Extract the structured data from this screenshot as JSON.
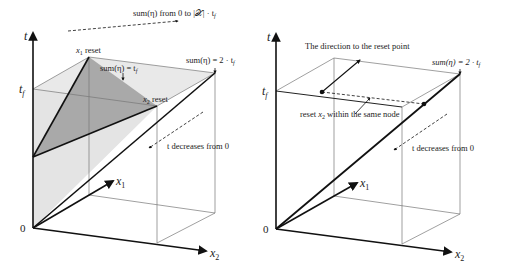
{
  "left_panel": {
    "axis_t": "t",
    "axis_x1": "x",
    "axis_x1_sub": "1",
    "axis_x2": "x",
    "axis_x2_sub": "2",
    "origin": "0",
    "tick_tf": "t",
    "tick_tf_sub": "f",
    "annotation_top": "sum(η) from 0 to |𝒳| · t",
    "annotation_top_sub": "f",
    "x1_reset": "reset",
    "x1_reset_var": "x",
    "x1_reset_sub": "1",
    "x2_reset": "reset",
    "x2_reset_var": "x",
    "x2_reset_sub": "2",
    "sum_eq_tf": "sum(η) = t",
    "sum_eq_tf_sub": "f",
    "sum_eq_2tf": "sum(η) = 2 · t",
    "sum_eq_2tf_sub": "f",
    "t_decreases": "t decreases from 0"
  },
  "right_panel": {
    "axis_t": "t",
    "axis_x1": "x",
    "axis_x1_sub": "1",
    "axis_x2": "x",
    "axis_x2_sub": "2",
    "origin": "0",
    "tick_tf": "t",
    "tick_tf_sub": "f",
    "direction_label": "The direction to the reset point",
    "reset_label_pre": "reset ",
    "reset_label_var": "x",
    "reset_label_sub": "2",
    "reset_label_post": " within the same node",
    "sum_eq_2tf": "sum(η) = 2 · t",
    "sum_eq_2tf_sub": "f",
    "t_decreases": "t decreases from 0"
  },
  "colors": {
    "light_fill": "#e6e6e6",
    "dark_fill": "#a8a8a8",
    "line": "#111111",
    "thin": "#888888"
  }
}
